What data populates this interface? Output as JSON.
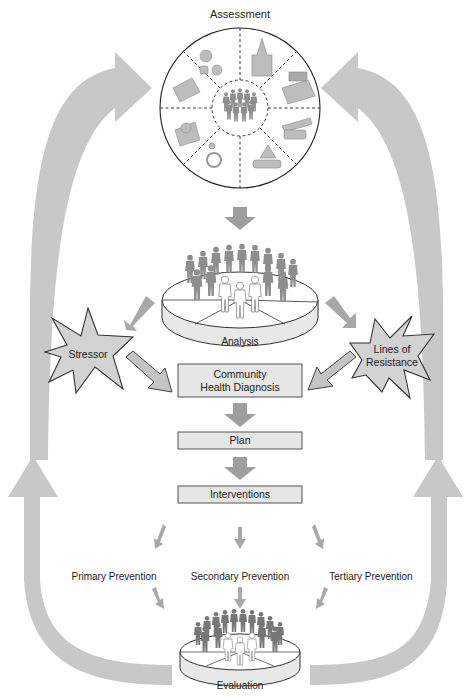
{
  "diagram": {
    "title": "Assessment",
    "assessment_wheel": {
      "center": "community-people-icon",
      "segments": [
        {
          "icon": "recreation-icon",
          "position": "top-left"
        },
        {
          "icon": "church-icon",
          "position": "top-right"
        },
        {
          "icon": "education-book-icon",
          "position": "right-upper"
        },
        {
          "icon": "transportation-icon",
          "position": "right-lower"
        },
        {
          "icon": "government-handshake-icon",
          "position": "bottom-right"
        },
        {
          "icon": "wheelchair-health-icon",
          "position": "bottom-left"
        },
        {
          "icon": "telephone-communication-icon",
          "position": "left-lower"
        },
        {
          "icon": "money-economics-icon",
          "position": "left-upper"
        }
      ]
    },
    "nodes": {
      "analysis": "Analysis",
      "stressor": "Stressor",
      "lines_of_resistance_1": "Lines of",
      "lines_of_resistance_2": "Resistance",
      "diagnosis_1": "Community",
      "diagnosis_2": "Health Diagnosis",
      "plan": "Plan",
      "interventions": "Interventions",
      "primary": "Primary Prevention",
      "secondary": "Secondary Prevention",
      "tertiary": "Tertiary Prevention",
      "evaluation": "Evaluation"
    },
    "colors": {
      "big_arrow": "#c8c8c8",
      "mid_arrow": "#9e9e9e",
      "box_fill": "#e6e6e6",
      "star_fill": "#d2d2d2"
    }
  }
}
